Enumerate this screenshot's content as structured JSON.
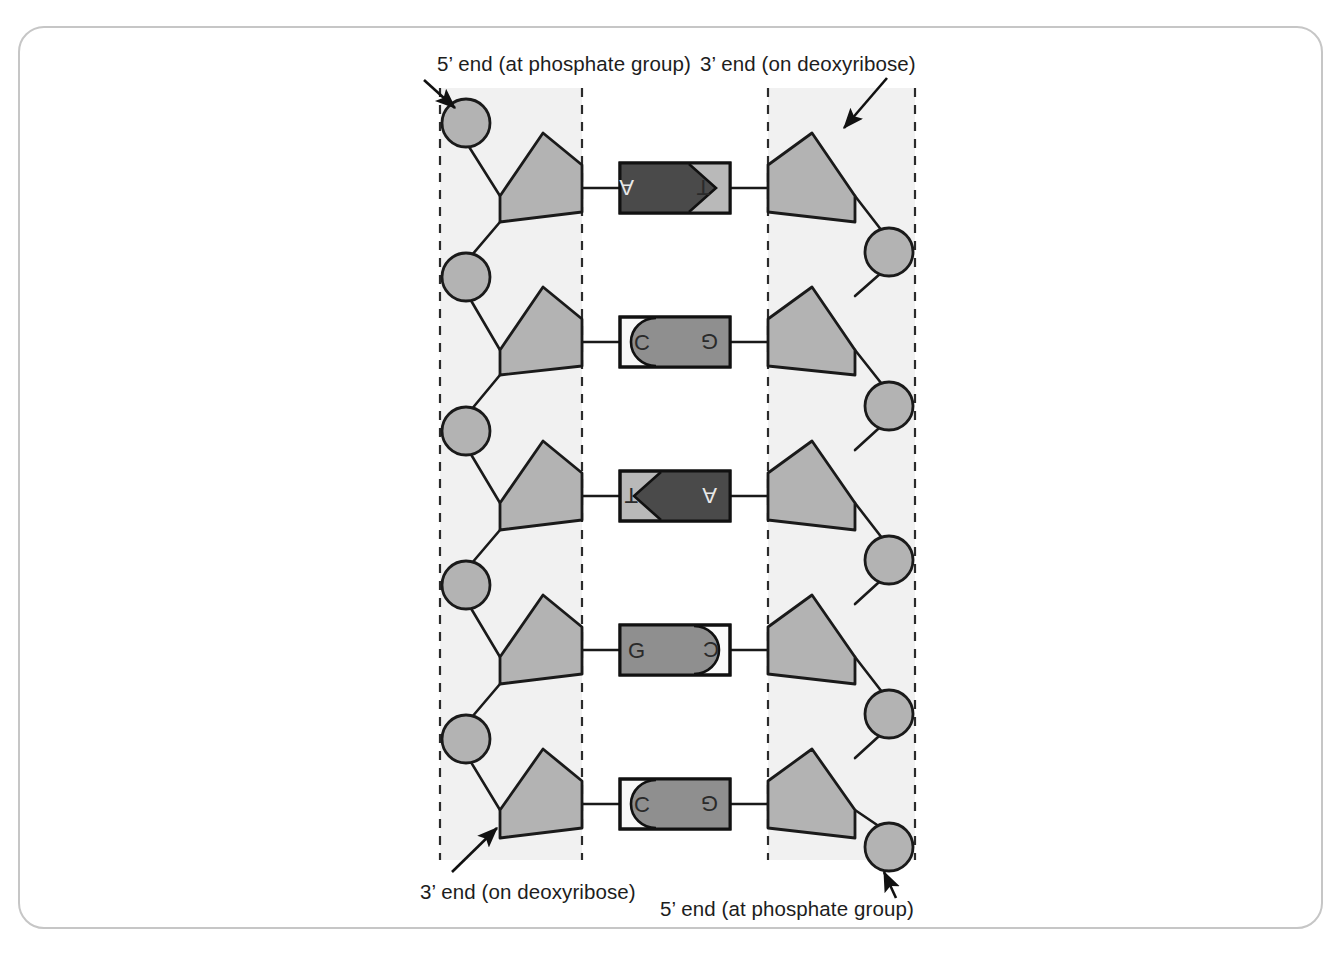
{
  "figure": {
    "labels": {
      "top_left": "5’ end (at phosphate group)",
      "top_right": "3’ end (on deoxyribose)",
      "bottom_left": "3’ end (on deoxyribose)",
      "bottom_right": "5’ end (at phosphate group)"
    },
    "base_pairs": [
      {
        "left_base": "A",
        "right_base": "T",
        "left_shape": "arrow-right",
        "right_shape": "notch-right",
        "left_fill": "#4a4a4a",
        "right_fill": "#b9b9b9"
      },
      {
        "left_base": "C",
        "right_base": "G",
        "left_shape": "concave-right",
        "right_shape": "round-left",
        "left_fill": "#f2f2f2",
        "right_fill": "#8f8f8f"
      },
      {
        "left_base": "T",
        "right_base": "A",
        "left_shape": "notch-right",
        "right_shape": "arrow-left",
        "left_fill": "#b9b9b9",
        "right_fill": "#4a4a4a"
      },
      {
        "left_base": "G",
        "right_base": "C",
        "left_shape": "round-right",
        "right_shape": "concave-left",
        "left_fill": "#8f8f8f",
        "right_fill": "#fbfbfb"
      },
      {
        "left_base": "C",
        "right_base": "G",
        "left_shape": "concave-right",
        "right_shape": "round-left",
        "left_fill": "#f2f2f2",
        "right_fill": "#8f8f8f"
      }
    ],
    "strands": {
      "left": {
        "direction": "5-prime top to 3-prime bottom",
        "sugar_count": 5,
        "phosphate_count": 5,
        "sugar_name": "deoxyribose",
        "phosphate_name": "phosphate"
      },
      "right": {
        "direction": "3-prime top to 5-prime bottom",
        "sugar_count": 5,
        "phosphate_count": 5,
        "sugar_name": "deoxyribose",
        "phosphate_name": "phosphate"
      }
    },
    "colors": {
      "sugar_fill": "#b3b3b3",
      "phosphate_fill": "#b3b3b3",
      "band_fill": "#f2f2f2",
      "outline": "#1a1a1a",
      "dashed_line": "#2b2b2b",
      "frame": "#c6c6c6",
      "text": "#1d1d1d"
    }
  }
}
